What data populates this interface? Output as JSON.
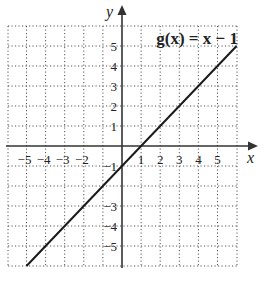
{
  "chart_data": {
    "type": "line",
    "title": "",
    "function_label": "g(x) = x − 1",
    "xlabel": "x",
    "ylabel": "y",
    "xlim": [
      -6,
      6
    ],
    "ylim": [
      -6,
      6
    ],
    "grid": true,
    "grid_style": "dotted",
    "x_ticks": [
      -5,
      -4,
      -3,
      -2,
      1,
      2,
      3,
      4,
      5
    ],
    "x_tick_labels": [
      "−5",
      "−4",
      "−3",
      "−2",
      "1",
      "2",
      "3",
      "4",
      "5"
    ],
    "y_ticks": [
      5,
      4,
      3,
      2,
      1,
      -1,
      -3,
      -4,
      -5
    ],
    "y_tick_labels": [
      "5",
      "4",
      "3",
      "2",
      "1",
      "−1",
      "−3",
      "−4",
      "−5"
    ],
    "series": [
      {
        "name": "g(x) = x − 1",
        "x": [
          -5,
          -4,
          -3,
          -2,
          -1,
          0,
          1,
          2,
          3,
          4,
          5,
          6
        ],
        "y": [
          -6,
          -5,
          -4,
          -3,
          -2,
          -1,
          0,
          1,
          2,
          3,
          4,
          5
        ]
      }
    ],
    "colors": {
      "line": "#1a1a1a",
      "grid": "#555555",
      "axes": "#333333"
    }
  },
  "labels": {
    "x_axis": "x",
    "y_axis": "y",
    "function": "g(x) = x − 1"
  }
}
